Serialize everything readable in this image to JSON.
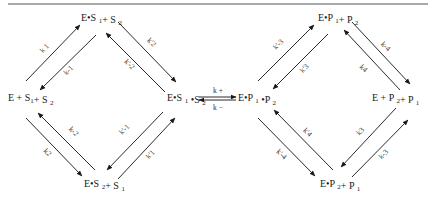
{
  "diagram": {
    "type": "kinetic-scheme",
    "rule": {
      "x1": 8,
      "y1": 4,
      "x2": 428,
      "y2": 4
    },
    "nodes": [
      {
        "id": "E_S1_S2_free",
        "parts": [
          [
            "E + S",
            ""
          ],
          [
            "1",
            "sub"
          ],
          [
            "+ S ",
            ""
          ],
          [
            "2",
            "sub"
          ]
        ],
        "x": 8,
        "y": 101,
        "text": "E + S1+ S2"
      },
      {
        "id": "ES1_S2",
        "parts": [
          [
            "E•S ",
            ""
          ],
          [
            "1",
            "sub"
          ],
          [
            "+ S ",
            ""
          ],
          [
            "2",
            "sub"
          ]
        ],
        "x": 81,
        "y": 21,
        "text": "E•S1+ S2"
      },
      {
        "id": "ES2_S1",
        "parts": [
          [
            "E•S ",
            ""
          ],
          [
            "2",
            "sub"
          ],
          [
            "+ S ",
            ""
          ],
          [
            "1",
            "sub"
          ]
        ],
        "x": 84,
        "y": 187,
        "text": "E•S2+ S1"
      },
      {
        "id": "ES1S2",
        "parts": [
          [
            "E•S ",
            ""
          ],
          [
            "1",
            "sub"
          ],
          [
            " •S ",
            ""
          ],
          [
            "2",
            "sub"
          ]
        ],
        "x": 167,
        "y": 101,
        "text": "E•S1•S2"
      },
      {
        "id": "EP1P2",
        "parts": [
          [
            "E•P ",
            ""
          ],
          [
            "1",
            "sub"
          ],
          [
            " •P ",
            ""
          ],
          [
            "2",
            "sub"
          ]
        ],
        "x": 238,
        "y": 101,
        "text": "E•P1•P2"
      },
      {
        "id": "EP1_P2",
        "parts": [
          [
            "E•P ",
            ""
          ],
          [
            "1",
            "sub"
          ],
          [
            "+ P ",
            ""
          ],
          [
            "2",
            "sub"
          ]
        ],
        "x": 318,
        "y": 21,
        "text": "E•P1+ P2"
      },
      {
        "id": "E_P2_P1_free",
        "parts": [
          [
            "E + P ",
            ""
          ],
          [
            "2",
            "sub"
          ],
          [
            "+ P ",
            ""
          ],
          [
            "1",
            "sub"
          ]
        ],
        "x": 372,
        "y": 101,
        "text": "E + P2+ P1"
      },
      {
        "id": "EP2_P1",
        "parts": [
          [
            "E•P ",
            ""
          ],
          [
            "2",
            "sub"
          ],
          [
            "+ P ",
            ""
          ],
          [
            "1",
            "sub"
          ]
        ],
        "x": 320,
        "y": 187,
        "text": "E•P2+ P1"
      }
    ],
    "arrows": [
      {
        "from": [
          26,
          81
        ],
        "to": [
          80,
          25
        ],
        "label": "k 1",
        "lx": 46,
        "ly": 50,
        "angle": -45
      },
      {
        "from": [
          96,
          35
        ],
        "to": [
          40,
          90
        ],
        "label": "k-1",
        "lx": 70,
        "ly": 72,
        "angle": -45
      },
      {
        "from": [
          118,
          22
        ],
        "to": [
          176,
          82
        ],
        "label": "k'2",
        "lx": 150,
        "ly": 44,
        "angle": 45
      },
      {
        "from": [
          165,
          92
        ],
        "to": [
          106,
          33
        ],
        "label": "k'-2",
        "lx": 128,
        "ly": 66,
        "angle": 45
      },
      {
        "from": [
          26,
          118
        ],
        "to": [
          82,
          176
        ],
        "label": "k2",
        "lx": 46,
        "ly": 154,
        "angle": 45
      },
      {
        "from": [
          95,
          170
        ],
        "to": [
          38,
          113
        ],
        "label": "k-2",
        "lx": 72,
        "ly": 133,
        "angle": 45
      },
      {
        "from": [
          163,
          112
        ],
        "to": [
          107,
          170
        ],
        "label": "k'-1",
        "lx": 126,
        "ly": 131,
        "angle": -45
      },
      {
        "from": [
          118,
          179
        ],
        "to": [
          175,
          118
        ],
        "label": "k'1",
        "lx": 152,
        "ly": 156,
        "angle": -45
      },
      {
        "from": [
          258,
          81
        ],
        "to": [
          314,
          25
        ],
        "label": "k'-3",
        "lx": 280,
        "ly": 46,
        "angle": -45
      },
      {
        "from": [
          328,
          34
        ],
        "to": [
          273,
          89
        ],
        "label": "k'3",
        "lx": 306,
        "ly": 70,
        "angle": -45
      },
      {
        "from": [
          352,
          22
        ],
        "to": [
          410,
          84
        ],
        "label": "k-4",
        "lx": 384,
        "ly": 48,
        "angle": 45
      },
      {
        "from": [
          400,
          90
        ],
        "to": [
          344,
          30
        ],
        "label": "k4",
        "lx": 362,
        "ly": 70,
        "angle": 45
      },
      {
        "from": [
          258,
          118
        ],
        "to": [
          315,
          176
        ],
        "label": "k'-4",
        "lx": 280,
        "ly": 156,
        "angle": 45
      },
      {
        "from": [
          333,
          170
        ],
        "to": [
          274,
          110
        ],
        "label": "k'4",
        "lx": 306,
        "ly": 134,
        "angle": 45
      },
      {
        "from": [
          396,
          108
        ],
        "to": [
          341,
          167
        ],
        "label": "k3",
        "lx": 362,
        "ly": 133,
        "angle": -45
      },
      {
        "from": [
          352,
          177
        ],
        "to": [
          408,
          120
        ],
        "label": "k-3",
        "lx": 385,
        "ly": 156,
        "angle": -45
      }
    ],
    "equilibrium": {
      "forward": {
        "x1": 199,
        "x2": 236,
        "y": 97,
        "label": "k +",
        "lx": 213,
        "ly": 93
      },
      "reverse": {
        "x1": 236,
        "x2": 199,
        "y": 100,
        "label": "k −",
        "lx": 213,
        "ly": 110
      }
    }
  }
}
